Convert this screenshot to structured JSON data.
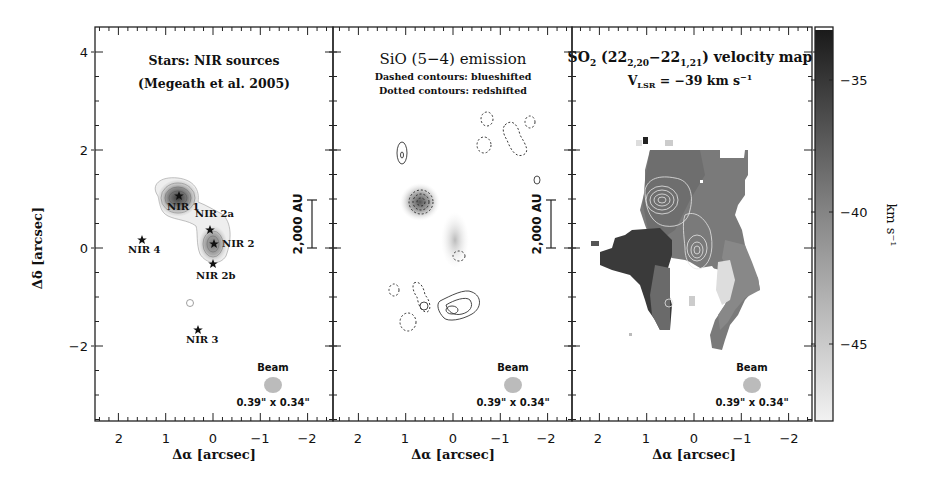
{
  "figure": {
    "panels": [
      {
        "id": "nir",
        "title_line1": "Stars: NIR sources",
        "title_line2": "(Megeath et al. 2005)",
        "scale_bar_label": "2,000 AU",
        "beam_label": "Beam",
        "beam_size": "0.39\" x 0.34\"",
        "sources": [
          {
            "name": "NIR 1",
            "dx": 0.75,
            "dy": 1.1
          },
          {
            "name": "NIR 2a",
            "dx": 0.1,
            "dy": 0.4
          },
          {
            "name": "NIR 2",
            "dx": -0.05,
            "dy": 0.1
          },
          {
            "name": "NIR 2b",
            "dx": 0.0,
            "dy": -0.3
          },
          {
            "name": "NIR 4",
            "dx": 1.5,
            "dy": 0.15
          },
          {
            "name": "NIR 3",
            "dx": 0.35,
            "dy": -1.6
          }
        ]
      },
      {
        "id": "sio",
        "title_main": "SiO (5−4) emission",
        "subtitle_line1": "Dashed contours: blueshifted",
        "subtitle_line2": "Dotted contours: redshifted",
        "scale_bar_label": "2,000 AU",
        "beam_label": "Beam",
        "beam_size": "0.39\" x 0.34\""
      },
      {
        "id": "so2",
        "title_prefix": "SO",
        "title_sub2": "2",
        "title_paren_open": " (22",
        "title_sub_a": "2,20",
        "title_dash": "−22",
        "title_sub_b": "1,21",
        "title_suffix": ") velocity map",
        "vlsr_prefix": "V",
        "vlsr_sub": "LSR",
        "vlsr_value": " = −39 km s",
        "vlsr_exp": "−1",
        "beam_label": "Beam",
        "beam_size": "0.39\" x 0.34\""
      }
    ],
    "x_axis_label": "Δα [arcsec]",
    "y_axis_label": "Δδ [arcsec]",
    "x_ticks": [
      "2",
      "1",
      "0",
      "−1",
      "−2"
    ],
    "y_ticks": [
      "4",
      "2",
      "0",
      "−2"
    ],
    "colorbar": {
      "label": "km s⁻¹",
      "ticks": [
        "−35",
        "−40",
        "−45"
      ],
      "color_top": "#1a1a1a",
      "color_bottom": "#f2f2f2"
    }
  },
  "chart_data": {
    "type": "heatmap",
    "xlabel": "Δα [arcsec]",
    "ylabel": "Δδ [arcsec]",
    "xlim": [
      2.5,
      -2.5
    ],
    "ylim": [
      -3.5,
      4.5
    ],
    "x_ticks": [
      2,
      1,
      0,
      -1,
      -2
    ],
    "y_ticks": [
      4,
      2,
      0,
      -2
    ],
    "panels": [
      {
        "name": "Stars: NIR sources (Megeath et al. 2005)",
        "type": "contour",
        "points": [
          {
            "label": "NIR 1",
            "x": 0.75,
            "y": 1.1
          },
          {
            "label": "NIR 2a",
            "x": 0.1,
            "y": 0.4
          },
          {
            "label": "NIR 2",
            "x": -0.05,
            "y": 0.1
          },
          {
            "label": "NIR 2b",
            "x": 0.0,
            "y": -0.3
          },
          {
            "label": "NIR 4",
            "x": 1.5,
            "y": 0.15
          },
          {
            "label": "NIR 3",
            "x": 0.35,
            "y": -1.6
          }
        ],
        "scale_bar": "2,000 AU",
        "beam": "0.39\" x 0.34\""
      },
      {
        "name": "SiO (5-4) emission",
        "type": "contour",
        "notes": [
          "Dashed contours: blueshifted",
          "Dotted contours: redshifted"
        ],
        "scale_bar": "2,000 AU",
        "beam": "0.39\" x 0.34\""
      },
      {
        "name": "SO2 (22_2,20-22_1,21) velocity map",
        "type": "heatmap",
        "vlsr": "-39 km s^-1",
        "colorbar_label": "km s^-1",
        "colorbar_range": [
          -48,
          -33
        ],
        "colorbar_ticks": [
          -35,
          -40,
          -45
        ],
        "beam": "0.39\" x 0.34\""
      }
    ]
  }
}
